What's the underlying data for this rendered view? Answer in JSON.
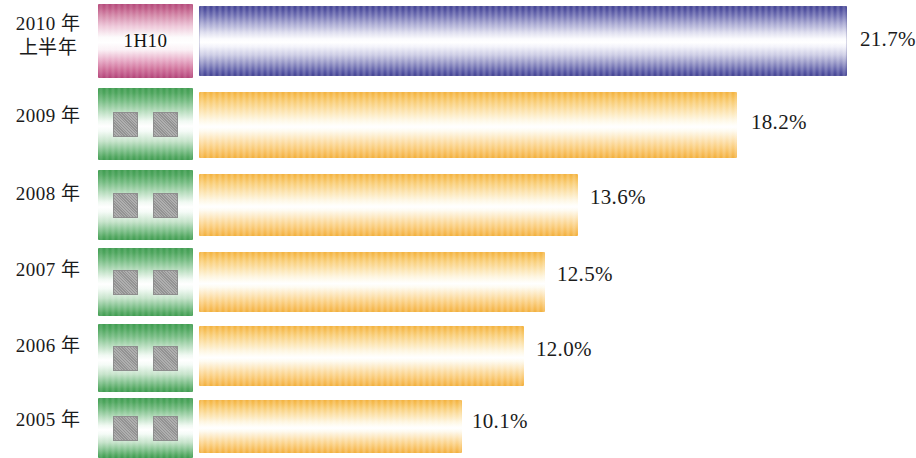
{
  "chart_data": {
    "type": "bar",
    "orientation": "horizontal",
    "title": "",
    "subtitle": "",
    "xlabel": "",
    "ylabel": "",
    "grid": false,
    "legend_position": "none",
    "value_suffix": "%",
    "xlim": [
      0,
      25
    ],
    "categories": [
      "2010 年\n上半年",
      "2009 年",
      "2008 年",
      "2007 年",
      "2006 年",
      "2005 年"
    ],
    "values": [
      21.7,
      18.2,
      13.6,
      12.5,
      12.0,
      10.1
    ],
    "value_labels": [
      "21.7%",
      "18.2%",
      "13.6%",
      "12.5%",
      "12.0%",
      "10.1%"
    ],
    "series": [
      {
        "name": "",
        "values": [
          21.7,
          18.2,
          13.6,
          12.5,
          12.0,
          10.1
        ]
      }
    ]
  },
  "colors": {
    "bar_blue": "#3e3e92",
    "bar_orange": "#f3b03a",
    "key_magenta": "#b4487a",
    "key_green": "#3d9b4e",
    "key_block_gray": "#9b9b9b",
    "text": "#1b1b1b",
    "background": "#ffffff"
  },
  "rows": [
    {
      "year_label": "2010 年\n上半年",
      "key_kind": "magenta",
      "key_text": "1H10",
      "key_blocks": 0,
      "value": 21.7,
      "value_label": "21.7%",
      "bar_color": "blue"
    },
    {
      "year_label": "2009 年",
      "key_kind": "green",
      "key_text": "",
      "key_blocks": 2,
      "value": 18.2,
      "value_label": "18.2%",
      "bar_color": "orange"
    },
    {
      "year_label": "2008 年",
      "key_kind": "green",
      "key_text": "",
      "key_blocks": 2,
      "value": 13.6,
      "value_label": "13.6%",
      "bar_color": "orange"
    },
    {
      "year_label": "2007 年",
      "key_kind": "green",
      "key_text": "",
      "key_blocks": 2,
      "value": 12.5,
      "value_label": "12.5%",
      "bar_color": "orange"
    },
    {
      "year_label": "2006 年",
      "key_kind": "green",
      "key_text": "",
      "key_blocks": 2,
      "value": 12.0,
      "value_label": "12.0%",
      "bar_color": "orange"
    },
    {
      "year_label": "2005 年",
      "key_kind": "green",
      "key_text": "",
      "key_blocks": 2,
      "value": 10.1,
      "value_label": "10.1%",
      "bar_color": "orange"
    }
  ],
  "layout": {
    "row_tops": [
      4,
      88,
      170,
      248,
      324,
      398
    ],
    "row_heights": [
      74,
      72,
      70,
      68,
      68,
      60
    ],
    "label_tops": [
      12,
      104,
      182,
      258,
      334,
      408
    ],
    "bar_tops": [
      6,
      92,
      174,
      252,
      326,
      400
    ],
    "bar_heights": [
      70,
      66,
      62,
      60,
      60,
      53
    ],
    "bar_left": 199,
    "bar_ends": [
      847,
      737,
      578,
      545,
      524,
      462
    ],
    "value_lefts": [
      860,
      751,
      590,
      557,
      536,
      472
    ],
    "value_tops": [
      27,
      110,
      185,
      262,
      337,
      409
    ]
  }
}
